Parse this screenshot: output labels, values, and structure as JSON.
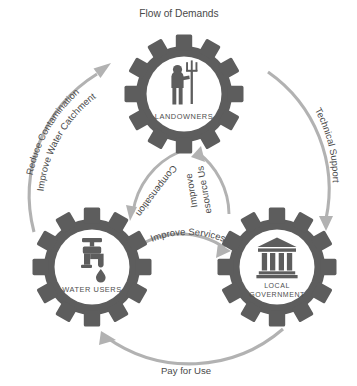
{
  "diagram": {
    "title": "Flow of Demands",
    "type": "cyclical-stakeholder-gear-diagram",
    "palette": {
      "gear": "#5d5d5d",
      "hub": "#ffffff",
      "arrow": "#b2b2b2",
      "text": "#4a4a4a",
      "background": "#ffffff"
    },
    "nodes": [
      {
        "id": "landowners",
        "label": "LANDOWNERS",
        "icon": "farmer-with-pitchfork-icon",
        "position": "top"
      },
      {
        "id": "water-users",
        "label": "WATER USERS",
        "icon": "water-tap-icon",
        "position": "bottom-left"
      },
      {
        "id": "local-government",
        "label_line1": "LOCAL",
        "label_line2": "GOVERNMENT",
        "icon": "government-building-icon",
        "position": "bottom-right"
      }
    ],
    "flows": [
      {
        "id": "flow-of-demands",
        "label": "Flow of Demands",
        "ring": "outer",
        "placement": "top-center"
      },
      {
        "id": "reduce-contamination",
        "label_line1": "Reduce Contamination",
        "label_line2": "Improve Water Catchment",
        "from": "water-users",
        "to": "landowners",
        "ring": "outer",
        "placement": "left"
      },
      {
        "id": "technical-support",
        "label": "Technical Support",
        "from": "landowners",
        "to": "local-government",
        "ring": "outer",
        "placement": "right"
      },
      {
        "id": "pay-for-use",
        "label": "Pay for Use",
        "from": "local-government",
        "to": "water-users",
        "ring": "outer",
        "placement": "bottom"
      },
      {
        "id": "compensation",
        "label": "Compensation",
        "from": "landowners",
        "to": "water-users",
        "ring": "inner",
        "placement": "inner-left"
      },
      {
        "id": "improve-resource-use",
        "label_line1": "Improve",
        "label_line2": "Resource Use",
        "from": "local-government",
        "to": "landowners",
        "ring": "inner",
        "placement": "inner-right"
      },
      {
        "id": "improve-services",
        "label": "Improve Services",
        "from": "water-users",
        "to": "local-government",
        "ring": "inner",
        "placement": "inner-bottom"
      }
    ]
  }
}
